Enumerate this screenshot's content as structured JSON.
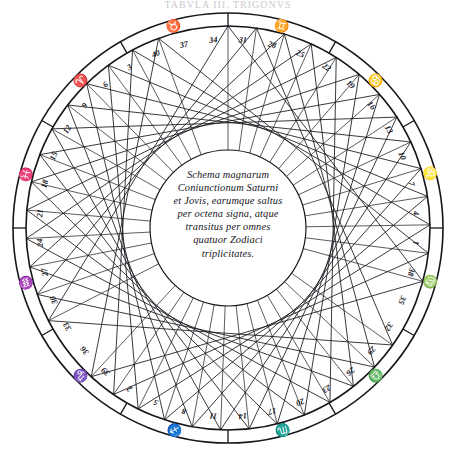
{
  "figure": {
    "name": "kepler-great-conjunctions-trigon",
    "cropped_header_text": "TABVLA III. TRIGONVS",
    "center_caption": "Schema magnarum Coniunctionum Saturni et Jovis, earumque saltus per octena signa, atque transitus per omnes quatuor Zodiaci triplicitates.",
    "center_caption_lines": [
      "Schema magnarum",
      "Coniunctionum Saturni",
      "et Jovis, earumque saltus",
      "per octena signa, atque",
      "transitus per omnes",
      "quatuor Zodiaci",
      "triplicitates."
    ],
    "ink_color": "#16161c",
    "background_color": "#ffffff"
  },
  "chart_data": {
    "type": "scatter",
    "point_count": 40,
    "step_signs": 8,
    "step_degrees": 242.7,
    "xlabel": "",
    "ylabel": "",
    "grid": false,
    "legend": false,
    "conjunction_numbers": [
      1,
      2,
      3,
      4,
      5,
      6,
      7,
      8,
      9,
      10,
      11,
      12,
      13,
      14,
      15,
      16,
      17,
      18,
      19,
      20,
      21,
      22,
      23,
      24,
      25,
      26,
      27,
      28,
      29,
      30,
      31,
      32,
      33,
      34,
      35,
      36,
      37,
      38,
      39,
      40
    ],
    "ring_labels_clockwise_from_top": [
      31,
      28,
      25,
      22,
      19,
      16,
      13,
      10,
      7,
      4,
      1,
      38,
      35,
      32,
      29,
      26,
      23,
      20,
      17,
      14,
      11,
      8,
      5,
      2,
      39,
      36,
      33,
      30,
      27,
      24,
      21,
      18,
      15,
      12,
      9,
      6,
      3,
      40,
      37,
      34
    ],
    "zodiac_signs": [
      {
        "name": "Aries",
        "latin": "Aries",
        "glyph": "♈",
        "degree": 0
      },
      {
        "name": "Taurus",
        "latin": "Taurus",
        "glyph": "♉",
        "degree": 30
      },
      {
        "name": "Gemini",
        "latin": "Gemini",
        "glyph": "♊",
        "degree": 60
      },
      {
        "name": "Cancer",
        "latin": "Cancer",
        "glyph": "♋",
        "degree": 90
      },
      {
        "name": "Leo",
        "latin": "Leo",
        "glyph": "♌",
        "degree": 120
      },
      {
        "name": "Virgo",
        "latin": "Virgo",
        "glyph": "♍",
        "degree": 150
      },
      {
        "name": "Libra",
        "latin": "Libra",
        "glyph": "♎",
        "degree": 180
      },
      {
        "name": "Scorpio",
        "latin": "Scorpius",
        "glyph": "♏",
        "degree": 210
      },
      {
        "name": "Sagittarius",
        "latin": "Sagittarius",
        "glyph": "♐",
        "degree": 240
      },
      {
        "name": "Capricorn",
        "latin": "Capricornus",
        "glyph": "♑",
        "degree": 270
      },
      {
        "name": "Aquarius",
        "latin": "Aquarius",
        "glyph": "♒",
        "degree": 300
      },
      {
        "name": "Pisces",
        "latin": "Pisces",
        "glyph": "♓",
        "degree": 330
      }
    ],
    "geometry": {
      "center_x": 228,
      "center_y": 228,
      "outer_ring_radius": 215,
      "inner_ring_radius": 202,
      "chord_circle_radius": 202,
      "envelope_radius": 78
    }
  }
}
